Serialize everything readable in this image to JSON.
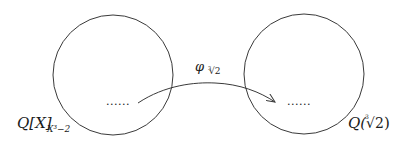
{
  "diagram": {
    "left_set": {
      "label_main": "Q[X]",
      "label_sub": "X³−2",
      "dots": "......"
    },
    "right_set": {
      "label_q": "Q(",
      "label_root_index": "3",
      "label_radical": "√2",
      "label_close": ")",
      "dots": "......"
    },
    "mapping": {
      "symbol": "φ",
      "sub_index": "3",
      "sub_radical": "√2"
    },
    "colors": {
      "stroke": "#3a3a3a",
      "text": "#1a1a1a",
      "background": "#ffffff"
    }
  }
}
